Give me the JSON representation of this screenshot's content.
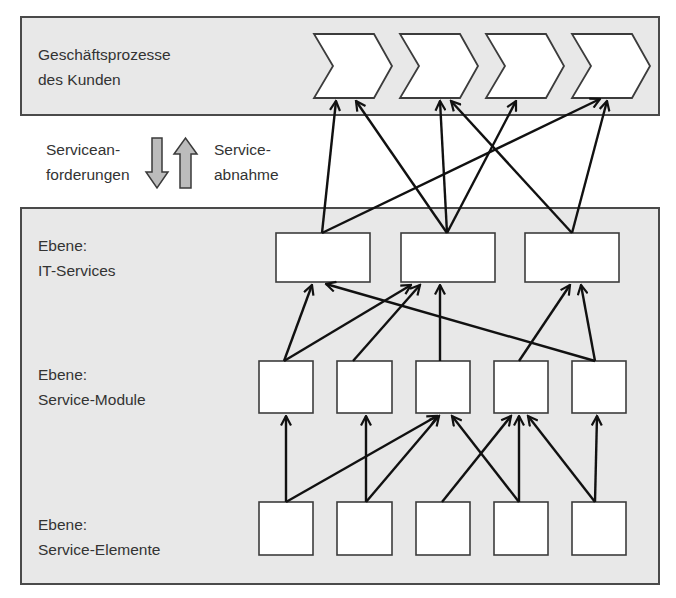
{
  "process_panel": {
    "label_line1": "Geschäftsprozesse",
    "label_line2": "des Kunden",
    "process_steps": [
      {
        "id": "p1",
        "x": 314
      },
      {
        "id": "p2",
        "x": 400
      },
      {
        "id": "p3",
        "x": 486
      },
      {
        "id": "p4",
        "x": 572
      }
    ]
  },
  "flow_legend": {
    "left_line1": "Servicean-",
    "left_line2": "forderungen",
    "right_line1": "Service-",
    "right_line2": "abnahme",
    "down_arrow": "down-arrow-icon",
    "up_arrow": "up-arrow-icon"
  },
  "levels": {
    "it_services": {
      "label_line1": "Ebene:",
      "label_line2": "IT-Services",
      "count": 3
    },
    "service_modules": {
      "label_line1": "Ebene:",
      "label_line2": "Service-Module",
      "count": 5
    },
    "service_elements": {
      "label_line1": "Ebene:",
      "label_line2": "Service-Elemente",
      "count": 5
    }
  },
  "connections": {
    "it_services_to_processes": [
      [
        "IT1",
        "P1"
      ],
      [
        "IT1",
        "P4"
      ],
      [
        "IT2",
        "P1"
      ],
      [
        "IT2",
        "P2"
      ],
      [
        "IT2",
        "P3"
      ],
      [
        "IT3",
        "P2"
      ],
      [
        "IT3",
        "P4"
      ]
    ],
    "modules_to_it_services": [
      [
        "M1",
        "IT1"
      ],
      [
        "M1",
        "IT2"
      ],
      [
        "M2",
        "IT2"
      ],
      [
        "M3",
        "IT2"
      ],
      [
        "M4",
        "IT3"
      ],
      [
        "M5",
        "IT1"
      ],
      [
        "M5",
        "IT3"
      ]
    ],
    "elements_to_modules": [
      [
        "E1",
        "M1"
      ],
      [
        "E1",
        "M3"
      ],
      [
        "E2",
        "M2"
      ],
      [
        "E2",
        "M3"
      ],
      [
        "E3",
        "M4"
      ],
      [
        "E4",
        "M3"
      ],
      [
        "E4",
        "M4"
      ],
      [
        "E5",
        "M4"
      ],
      [
        "E5",
        "M5"
      ]
    ]
  },
  "colors": {
    "panel_fill": "#e8e8e8",
    "box_fill": "#ffffff",
    "arrow": "#111111",
    "flow_arrow_fill": "#bcbcbc",
    "text": "#333333"
  }
}
